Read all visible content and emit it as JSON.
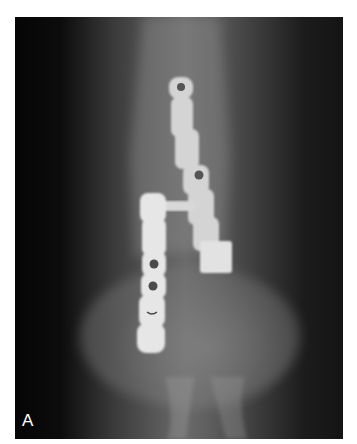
{
  "figure": {
    "panel_label": "A",
    "colors": {
      "background": "#ffffff",
      "film_dark": "#0a0a0a",
      "film_mid": "#5c5c5c",
      "hardware": "#e6e6e6",
      "label": "#ffffff"
    }
  }
}
